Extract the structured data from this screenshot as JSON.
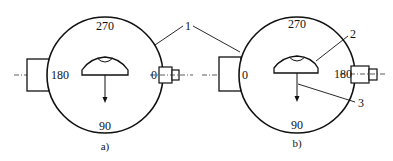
{
  "figure_a": {
    "caption": "a)",
    "angles": {
      "top": "270",
      "bottom": "90",
      "left": "180",
      "right": "0"
    }
  },
  "figure_b": {
    "caption": "b)",
    "angles": {
      "top": "270",
      "bottom": "90",
      "left": "0",
      "right": "180"
    }
  },
  "callouts": {
    "c1": "1",
    "c2": "2",
    "c3": "3"
  }
}
